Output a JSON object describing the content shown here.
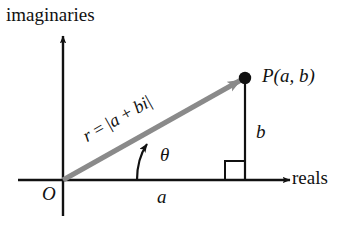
{
  "figure": {
    "axes": {
      "vertical_label": "imaginaries",
      "horizontal_label": "reals",
      "origin_label": "O"
    },
    "labels": {
      "point": "P(a, b)",
      "horizontal_leg": "a",
      "vertical_leg": "b",
      "angle": "θ",
      "modulus_prefix": "r",
      "modulus_equals": "=",
      "modulus_open_bar": "|",
      "modulus_a": "a",
      "modulus_plus": "+",
      "modulus_bi": "bi",
      "modulus_close_bar": "|",
      "modulus_full": "r = |a + bi|"
    },
    "colors": {
      "ink": "#111111",
      "vector": "#8a8a8a",
      "background": "#ffffff"
    },
    "geometry": {
      "origin_x": 63,
      "origin_y": 180,
      "point_x": 245,
      "point_y": 78,
      "angle_degrees": 29.3
    }
  }
}
